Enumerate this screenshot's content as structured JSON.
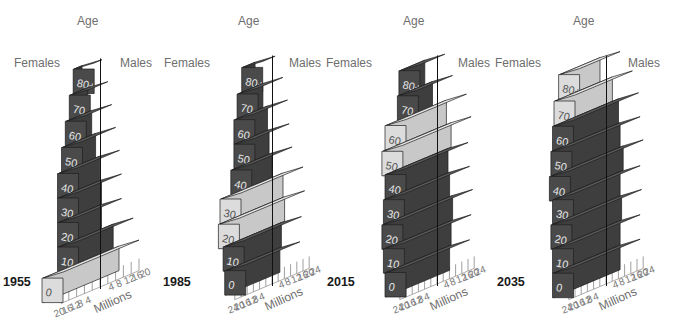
{
  "chart_data": [
    {
      "type": "bar",
      "subtype": "3d-population-pyramid",
      "year": "1955",
      "title": "1955",
      "axis_title": "Age",
      "left_label": "Females",
      "right_label": "Males",
      "xlabel": "Millions",
      "x_ticks_female": [
        "20",
        "16",
        "12",
        "8",
        "4"
      ],
      "x_ticks_male": [
        "4",
        "8",
        "12",
        "16",
        "20"
      ],
      "xlim": [
        0,
        20
      ],
      "categories": [
        "0",
        "10",
        "20",
        "30",
        "40",
        "50",
        "60",
        "70",
        "80+"
      ],
      "series": [
        {
          "name": "Females",
          "values": [
            19,
            11,
            11,
            11,
            11,
            9,
            7,
            5,
            3
          ]
        },
        {
          "name": "Males",
          "values": [
            20,
            17,
            11,
            11,
            10,
            8,
            6,
            4,
            1
          ]
        }
      ],
      "highlighted": [
        "0"
      ]
    },
    {
      "type": "bar",
      "subtype": "3d-population-pyramid",
      "year": "1985",
      "title": "1985",
      "axis_title": "Age",
      "left_label": "Females",
      "right_label": "Males",
      "xlabel": "Millions",
      "x_ticks_female": [
        "24",
        "20",
        "16",
        "12",
        "8",
        "4"
      ],
      "x_ticks_male": [
        "4",
        "8",
        "12",
        "16",
        "20",
        "24"
      ],
      "xlim": [
        0,
        24
      ],
      "categories": [
        "0",
        "10",
        "20",
        "30",
        "40",
        "50",
        "60",
        "70",
        "80+"
      ],
      "series": [
        {
          "name": "Females",
          "values": [
            17,
            18,
            21,
            20,
            13,
            11,
            11,
            9,
            6
          ]
        },
        {
          "name": "Males",
          "values": [
            18,
            19,
            21,
            20,
            13,
            11,
            10,
            7,
            2
          ]
        }
      ],
      "highlighted": [
        "20",
        "30"
      ]
    },
    {
      "type": "bar",
      "subtype": "3d-population-pyramid",
      "year": "2015",
      "title": "2015",
      "axis_title": "Age",
      "left_label": "Females",
      "right_label": "Males",
      "xlabel": "Millions",
      "x_ticks_female": [
        "24",
        "20",
        "16",
        "12",
        "8",
        "4"
      ],
      "x_ticks_male": [
        "4",
        "8",
        "12",
        "16",
        "20",
        "24"
      ],
      "xlim": [
        0,
        24
      ],
      "categories": [
        "0",
        "10",
        "20",
        "30",
        "40",
        "50",
        "60",
        "70",
        "80+"
      ],
      "series": [
        {
          "name": "Females",
          "values": [
            20,
            21,
            22,
            21,
            20,
            22,
            20,
            12,
            11
          ]
        },
        {
          "name": "Males",
          "values": [
            21,
            22,
            23,
            21,
            20,
            22,
            19,
            10,
            5
          ]
        }
      ],
      "highlighted": [
        "50",
        "60"
      ]
    },
    {
      "type": "bar",
      "subtype": "3d-population-pyramid",
      "year": "2035",
      "title": "2035",
      "axis_title": "Age",
      "left_label": "Females",
      "right_label": "Males",
      "xlabel": "Millions",
      "x_ticks_female": [
        "24",
        "20",
        "16",
        "12",
        "8",
        "4"
      ],
      "x_ticks_male": [
        "4",
        "8",
        "12",
        "16",
        "20",
        "24"
      ],
      "xlim": [
        0,
        24
      ],
      "categories": [
        "0",
        "10",
        "20",
        "30",
        "40",
        "50",
        "60",
        "70",
        "80+"
      ],
      "series": [
        {
          "name": "Females",
          "values": [
            21,
            21,
            22,
            21,
            23,
            22,
            21,
            20,
            17
          ]
        },
        {
          "name": "Males",
          "values": [
            22,
            22,
            23,
            22,
            24,
            22,
            21,
            17,
            9
          ]
        }
      ],
      "highlighted": [
        "70",
        "80+"
      ]
    }
  ],
  "colors": {
    "dark_front": "#4a4a4a",
    "dark_side": "#3e3e3e",
    "dark_top": "#5a5a5a",
    "light_front": "#dcdcdc",
    "light_side": "#c8c8c8",
    "light_top": "#e8e8e8",
    "edge": "#1e1e1e",
    "label_on_dark": "#e6e6e6",
    "label_on_light": "#555555"
  }
}
